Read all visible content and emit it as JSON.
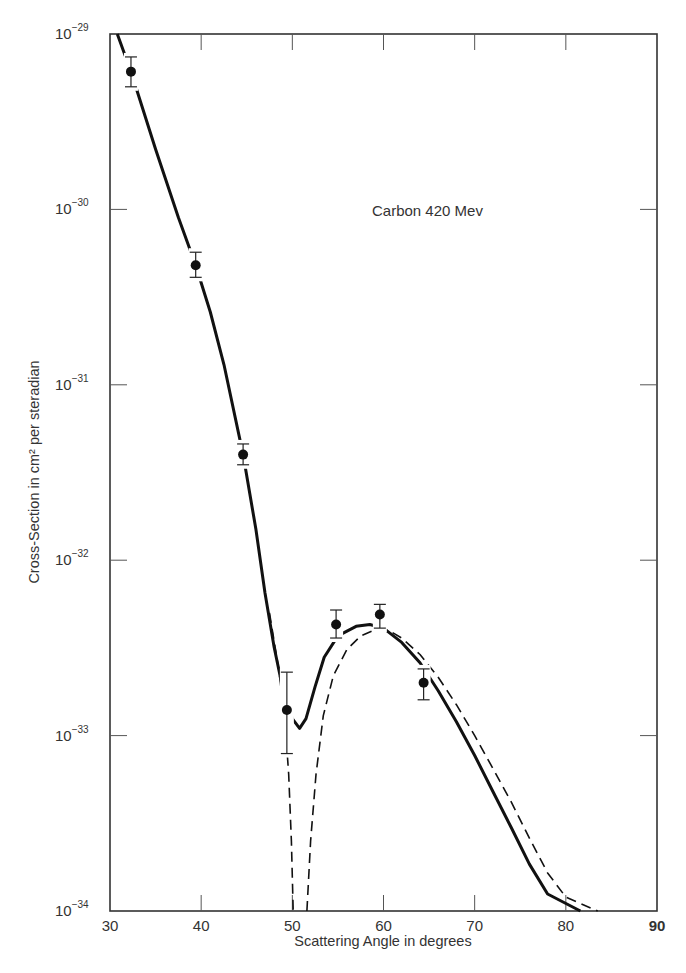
{
  "chart_data": {
    "type": "line",
    "title": "",
    "annotation": "Carbon 420 Mev",
    "xlabel": "Scattering Angle in degrees",
    "ylabel": "Cross-Section in cm² per steradian",
    "xlim": [
      30,
      90
    ],
    "ylim": [
      1e-34,
      1e-29
    ],
    "yscale": "log",
    "grid": false,
    "legend": null,
    "x_ticks": [
      30,
      40,
      50,
      60,
      70,
      80,
      90
    ],
    "x_tick_labels": [
      "30",
      "40",
      "50",
      "60",
      "70",
      "80",
      "90"
    ],
    "y_ticks": [
      -29,
      -30,
      -31,
      -32,
      -33,
      -34
    ],
    "y_tick_labels": [
      {
        "base": "10",
        "exp": "−29"
      },
      {
        "base": "10",
        "exp": "−30"
      },
      {
        "base": "10",
        "exp": "−31"
      },
      {
        "base": "10",
        "exp": "−32"
      },
      {
        "base": "10",
        "exp": "−33"
      },
      {
        "base": "10",
        "exp": "−34"
      }
    ],
    "series": [
      {
        "name": "Measured",
        "style": "points-with-error-bars",
        "points": [
          {
            "x": 32.3,
            "y": 6.1e-30,
            "err_low": 5e-30,
            "err_high": 7.4e-30
          },
          {
            "x": 39.4,
            "y": 4.8e-31,
            "err_low": 4.1e-31,
            "err_high": 5.7e-31
          },
          {
            "x": 44.6,
            "y": 4e-32,
            "err_low": 3.5e-32,
            "err_high": 4.6e-32
          },
          {
            "x": 49.4,
            "y": 1.4e-33,
            "err_low": 7.9e-34,
            "err_high": 2.3e-33
          },
          {
            "x": 54.8,
            "y": 4.3e-33,
            "err_low": 3.6e-33,
            "err_high": 5.2e-33
          },
          {
            "x": 59.6,
            "y": 4.9e-33,
            "err_low": 4.1e-33,
            "err_high": 5.6e-33
          },
          {
            "x": 64.4,
            "y": 2e-33,
            "err_low": 1.6e-33,
            "err_high": 2.4e-33
          }
        ]
      },
      {
        "name": "Theory (solid)",
        "style": "solid",
        "points": [
          [
            30.8,
            1e-29
          ],
          [
            32.3,
            6.1e-30
          ],
          [
            35.0,
            2.2e-30
          ],
          [
            37.5,
            9e-31
          ],
          [
            39.4,
            4.8e-31
          ],
          [
            41.0,
            2.6e-31
          ],
          [
            42.5,
            1.3e-31
          ],
          [
            44.6,
            4e-32
          ],
          [
            46.0,
            1.5e-32
          ],
          [
            47.0,
            6.5e-33
          ],
          [
            48.0,
            3.2e-33
          ],
          [
            49.0,
            1.8e-33
          ],
          [
            50.0,
            1.25e-33
          ],
          [
            50.8,
            1.1e-33
          ],
          [
            51.5,
            1.25e-33
          ],
          [
            52.5,
            1.9e-33
          ],
          [
            53.5,
            2.8e-33
          ],
          [
            55.0,
            3.7e-33
          ],
          [
            57.0,
            4.2e-33
          ],
          [
            58.5,
            4.3e-33
          ],
          [
            60.0,
            4.1e-33
          ],
          [
            62.0,
            3.4e-33
          ],
          [
            64.0,
            2.6e-33
          ],
          [
            66.0,
            1.8e-33
          ],
          [
            68.0,
            1.2e-33
          ],
          [
            70.0,
            7.7e-34
          ],
          [
            72.0,
            4.8e-34
          ],
          [
            74.0,
            3e-34
          ],
          [
            76.0,
            1.85e-34
          ],
          [
            78.0,
            1.25e-34
          ],
          [
            81.6,
            1e-34
          ]
        ]
      },
      {
        "name": "Theory (dashed)",
        "style": "dashed",
        "points": [
          [
            47.5,
            5e-33
          ],
          [
            48.5,
            2.4e-33
          ],
          [
            49.2,
            1.2e-33
          ],
          [
            49.6,
            6e-34
          ],
          [
            49.9,
            2.5e-34
          ],
          [
            50.1,
            1e-34
          ],
          null,
          [
            51.6,
            1e-34
          ],
          [
            52.0,
            2.5e-34
          ],
          [
            52.6,
            6e-34
          ],
          [
            53.4,
            1.3e-33
          ],
          [
            54.5,
            2.2e-33
          ],
          [
            56.0,
            3.1e-33
          ],
          [
            57.5,
            3.7e-33
          ],
          [
            59.0,
            4e-33
          ],
          [
            60.5,
            4e-33
          ],
          [
            62.0,
            3.6e-33
          ],
          [
            64.0,
            2.9e-33
          ],
          [
            66.0,
            2.15e-33
          ],
          [
            68.0,
            1.5e-33
          ],
          [
            70.0,
            1e-33
          ],
          [
            72.0,
            6.5e-34
          ],
          [
            74.0,
            4.2e-34
          ],
          [
            76.0,
            2.6e-34
          ],
          [
            78.0,
            1.65e-34
          ],
          [
            80.0,
            1.2e-34
          ],
          [
            83.5,
            1e-34
          ]
        ]
      }
    ]
  }
}
